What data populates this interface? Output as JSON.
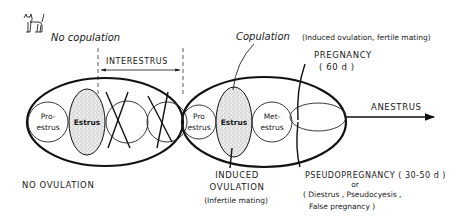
{
  "header": {
    "icon": "cat-icon",
    "title": "No copulation"
  },
  "no_copulation_cycle": {
    "interestrus_label": "INTERESTRUS",
    "proestrus_line1": "Pro-",
    "proestrus_line2": "estrus",
    "estrus_label": "Estrus",
    "outcome_label": "NO OVULATION"
  },
  "copulation_cycle": {
    "copulation_label": "Copulation",
    "copulation_note": "(Induced ovulation, fertile mating)",
    "proestrus_line1": "Pro",
    "proestrus_line2": "estrus",
    "estrus_label": "Estrus",
    "metestrus_line1": "Met-",
    "metestrus_line2": "estrus",
    "pregnancy_label": "PREGNANCY",
    "pregnancy_duration": "( 60 d )",
    "anestrus_label": "ANESTRUS",
    "induced_line1": "INDUCED",
    "induced_line2": "OVULATION",
    "induced_note": "(Infertile mating)",
    "pseudo_line1": "PSEUDOPREGNANCY ( 30-50 d )",
    "pseudo_or": "or",
    "pseudo_line2": "( Diestrus , Pseudocyesis ,",
    "pseudo_line3": "False pregnancy )"
  },
  "colors": {
    "ink": "#111111",
    "background": "#ffffff",
    "stipple": "#bdbdbd"
  }
}
